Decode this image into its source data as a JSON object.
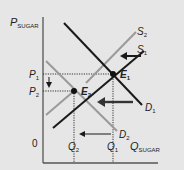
{
  "diagram": {
    "y_axis_label": "P",
    "y_axis_sub": "SUGAR",
    "x_axis_label": "Q",
    "x_axis_sub": "SUGAR",
    "origin_label": "0",
    "price_labels": [
      {
        "main": "P",
        "sub": "1"
      },
      {
        "main": "P",
        "sub": "2"
      }
    ],
    "quantity_labels": [
      {
        "main": "Q",
        "sub": "2"
      },
      {
        "main": "Q",
        "sub": "1"
      }
    ],
    "curves": [
      {
        "name": "S",
        "sub": "1",
        "color": "#1a1a1a"
      },
      {
        "name": "S",
        "sub": "2",
        "color": "#9a9a9a"
      },
      {
        "name": "D",
        "sub": "1",
        "color": "#1a1a1a"
      },
      {
        "name": "D",
        "sub": "2",
        "color": "#9a9a9a"
      }
    ],
    "equilibria": [
      {
        "name": "E",
        "sub": "1"
      },
      {
        "name": "E",
        "sub": "2"
      }
    ],
    "colors": {
      "background": "#e6e6e6",
      "dark": "#1a1a1a",
      "light": "#9a9a9a",
      "dotted": "#333333"
    }
  }
}
